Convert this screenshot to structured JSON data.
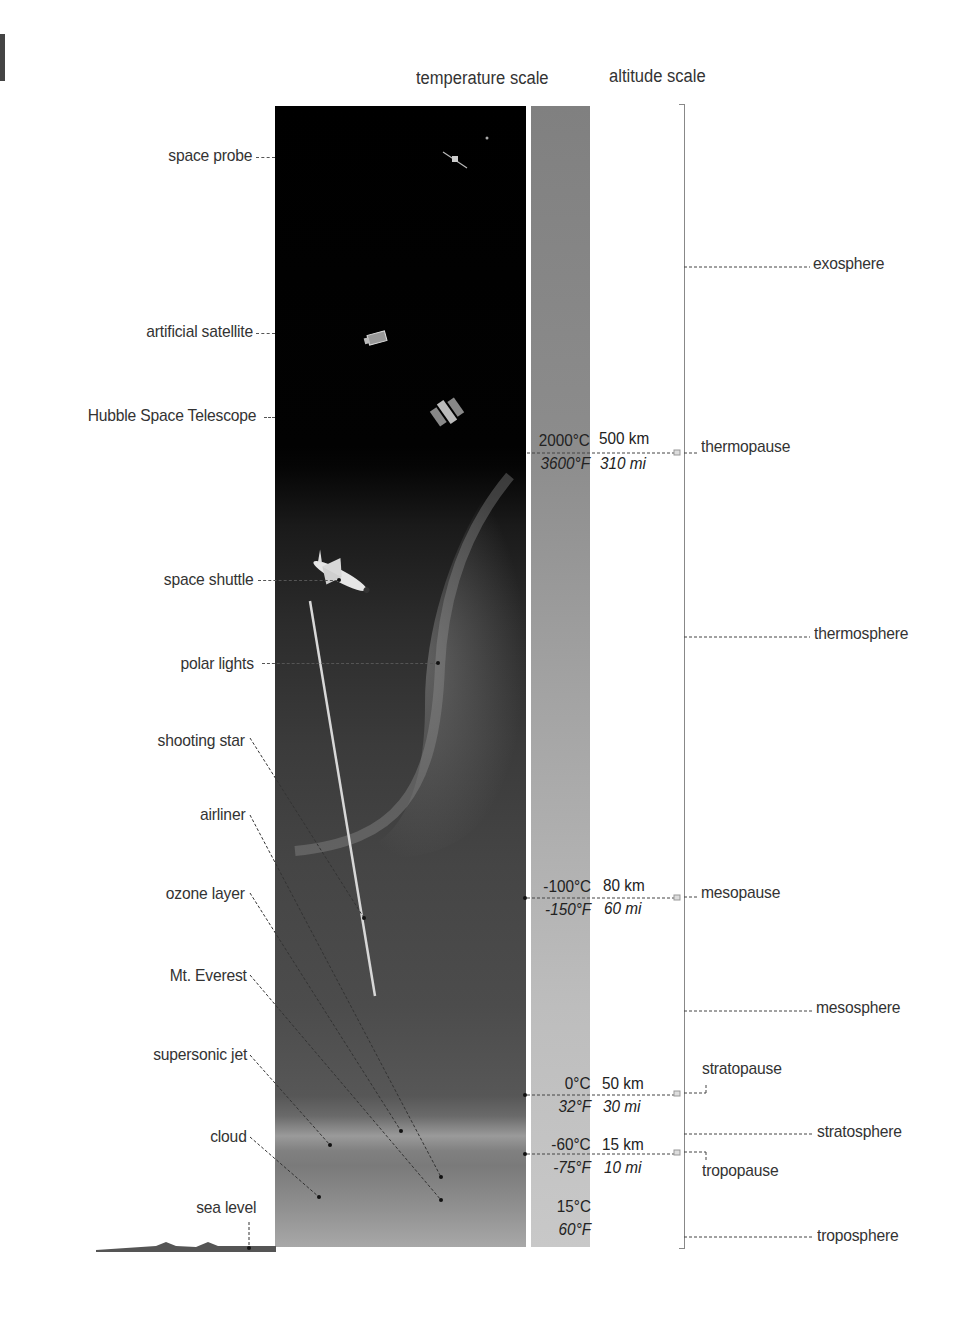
{
  "headers": {
    "temperature_scale": "temperature scale",
    "altitude_scale": "altitude scale"
  },
  "objects": [
    {
      "label": "space probe",
      "icon": "space-probe-icon"
    },
    {
      "label": "artificial satellite",
      "icon": "satellite-icon"
    },
    {
      "label": "Hubble Space Telescope",
      "icon": "telescope-icon"
    },
    {
      "label": "space shuttle",
      "icon": "shuttle-icon"
    },
    {
      "label": "polar lights",
      "icon": "aurora-icon"
    },
    {
      "label": "shooting star",
      "icon": "meteor-icon"
    },
    {
      "label": "airliner",
      "icon": "airliner-icon"
    },
    {
      "label": "ozone layer",
      "icon": "ozone-icon"
    },
    {
      "label": "Mt. Everest",
      "icon": "mountain-icon"
    },
    {
      "label": "supersonic jet",
      "icon": "jet-icon"
    },
    {
      "label": "cloud",
      "icon": "cloud-icon"
    },
    {
      "label": "sea level",
      "icon": "ground-icon"
    }
  ],
  "boundaries": [
    {
      "name": "thermopause",
      "temp_c": "2000°C",
      "temp_f": "3600°F",
      "alt_km": "500 km",
      "alt_mi": "310 mi"
    },
    {
      "name": "mesopause",
      "temp_c": "-100°C",
      "temp_f": "-150°F",
      "alt_km": "80 km",
      "alt_mi": "60 mi"
    },
    {
      "name": "stratopause",
      "temp_c": "0°C",
      "temp_f": "32°F",
      "alt_km": "50 km",
      "alt_mi": "30 mi"
    },
    {
      "name": "tropopause",
      "temp_c": "-60°C",
      "temp_f": "-75°F",
      "alt_km": "15 km",
      "alt_mi": "10 mi"
    }
  ],
  "surface": {
    "temp_c": "15°C",
    "temp_f": "60°F"
  },
  "layers": [
    {
      "name": "exosphere"
    },
    {
      "name": "thermosphere"
    },
    {
      "name": "mesosphere"
    },
    {
      "name": "stratosphere"
    },
    {
      "name": "troposphere"
    }
  ],
  "colors": {
    "space": "#000000",
    "sky_low": "#a8a8a8",
    "temp_bar_top": "#808080",
    "temp_bar_bottom": "#c8c8c8",
    "text": "#333333"
  }
}
